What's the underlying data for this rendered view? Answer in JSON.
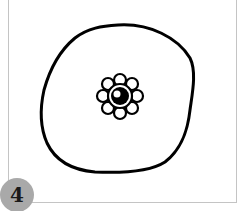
{
  "figure": {
    "step_number": "4",
    "colors": {
      "frame_border": "#c4c4c4",
      "badge_fill": "#a9a9a9",
      "stroke": "#000000",
      "background": "#ffffff"
    },
    "shapes": [
      {
        "name": "outer-blob",
        "description": "large hand-drawn rounded outline"
      },
      {
        "name": "flower",
        "description": "small flower with eight petals and a ringed eye center"
      }
    ]
  }
}
